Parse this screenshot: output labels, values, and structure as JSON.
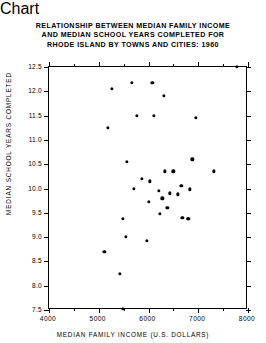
{
  "chart_data": {
    "type": "scatter",
    "title": "RELATIONSHIP BETWEEN MEDIAN FAMILY INCOME AND MEDIAN SCHOOL YEARS COMPLETED FOR RHODE ISLAND BY TOWNS AND CITIES:  1960",
    "title_lines": [
      "RELATIONSHIP BETWEEN MEDIAN FAMILY INCOME",
      "AND MEDIAN SCHOOL YEARS COMPLETED FOR",
      "RHODE ISLAND BY TOWNS AND CITIES:  1960"
    ],
    "xlabel": "MEDIAN  FAMILY  INCOME  (U.S.  DOLLARS)",
    "ylabel": "MEDIAN  SCHOOL  YEARS  COMPLETED",
    "xlim": [
      4000,
      8000
    ],
    "ylim": [
      7.5,
      12.5
    ],
    "grid": false,
    "legend": null,
    "xticks": [
      4000,
      5000,
      6000,
      7000,
      8000
    ],
    "xtick_labels": [
      "4000",
      "5000",
      "6000",
      "7000",
      "8000"
    ],
    "xminor_ticks": [
      4500,
      5500,
      6500,
      7500
    ],
    "yticks": [
      7.5,
      8.0,
      8.5,
      9.0,
      9.5,
      10.0,
      10.5,
      11.0,
      11.5,
      12.0,
      12.5
    ],
    "ytick_labels": [
      "7.5",
      "8.0",
      "8.5",
      "9.0",
      "9.5",
      "10.0",
      "10.5",
      "11.0",
      "11.5",
      "12.0",
      "12.5"
    ],
    "marker": "filled-circle",
    "marker_color": "#000000",
    "points": [
      {
        "x": 7780,
        "y": 12.5
      },
      {
        "x": 5260,
        "y": 12.05
      },
      {
        "x": 5660,
        "y": 12.18
      },
      {
        "x": 6080,
        "y": 12.18
      },
      {
        "x": 6310,
        "y": 11.9
      },
      {
        "x": 5760,
        "y": 11.5
      },
      {
        "x": 6110,
        "y": 11.5
      },
      {
        "x": 6950,
        "y": 11.45
      },
      {
        "x": 5180,
        "y": 11.25
      },
      {
        "x": 5560,
        "y": 10.55
      },
      {
        "x": 6880,
        "y": 10.6
      },
      {
        "x": 6330,
        "y": 10.35
      },
      {
        "x": 6500,
        "y": 10.35
      },
      {
        "x": 7320,
        "y": 10.35
      },
      {
        "x": 5870,
        "y": 10.2
      },
      {
        "x": 6030,
        "y": 10.15
      },
      {
        "x": 5710,
        "y": 10.0
      },
      {
        "x": 6660,
        "y": 10.05
      },
      {
        "x": 6830,
        "y": 9.98
      },
      {
        "x": 6210,
        "y": 9.95
      },
      {
        "x": 6430,
        "y": 9.9
      },
      {
        "x": 6590,
        "y": 9.88
      },
      {
        "x": 6280,
        "y": 9.8
      },
      {
        "x": 6000,
        "y": 9.72
      },
      {
        "x": 6380,
        "y": 9.6
      },
      {
        "x": 6230,
        "y": 9.48
      },
      {
        "x": 6680,
        "y": 9.4
      },
      {
        "x": 6790,
        "y": 9.38
      },
      {
        "x": 6800,
        "y": 9.38
      },
      {
        "x": 5490,
        "y": 9.38
      },
      {
        "x": 5550,
        "y": 9.0
      },
      {
        "x": 5960,
        "y": 8.92
      },
      {
        "x": 5110,
        "y": 8.7
      },
      {
        "x": 5420,
        "y": 8.25
      },
      {
        "x": 5490,
        "y": 7.52
      }
    ]
  },
  "axes": {
    "x_title": "MEDIAN  FAMILY  INCOME  (U.S.  DOLLARS)",
    "y_title": "MEDIAN  SCHOOL  YEARS  COMPLETED"
  }
}
